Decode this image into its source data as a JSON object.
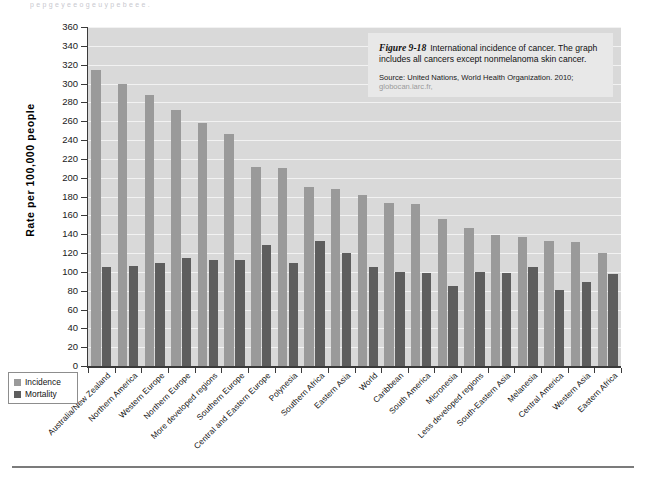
{
  "page": {
    "top_text_fragment": "p       e   p      g     e     y     e    e   o   g     e   u   y   p          e  b           e      e  e  ."
  },
  "caption": {
    "figure_number": "Figure 9-18",
    "text": "International incidence of cancer. The graph includes all cancers except nonmelanoma skin cancer.",
    "source_prefix": "Source: United Nations, World Health Organization. 2010;",
    "source_url": "globocan.iarc.fr,"
  },
  "legend": {
    "position": "bottom-left",
    "items": [
      {
        "label": "Incidence",
        "color": "#9a9a9a"
      },
      {
        "label": "Mortality",
        "color": "#5e5e5e"
      }
    ]
  },
  "chart_data": {
    "type": "bar",
    "title": "International incidence of cancer",
    "xlabel": "",
    "ylabel": "Rate per 100,000 people",
    "ylim": [
      0,
      360
    ],
    "ytick_step": 20,
    "yticks": [
      0,
      20,
      40,
      60,
      80,
      100,
      120,
      140,
      160,
      180,
      200,
      220,
      240,
      260,
      280,
      300,
      320,
      340,
      360
    ],
    "grid": true,
    "legend_position": "bottom-left",
    "categories": [
      "Australia/New Zealand",
      "Northern America",
      "Western Europe",
      "Northern Europe",
      "More developed regions",
      "Southern Europe",
      "Central and Eastern Europe",
      "Polynesia",
      "Southern Africa",
      "Eastern Asia",
      "World",
      "Caribbean",
      "South America",
      "Micronesia",
      "Less developed regions",
      "South-Eastern Asia",
      "Melanesia",
      "Central America",
      "Western Asia",
      "Eastern Africa"
    ],
    "series": [
      {
        "name": "Incidence",
        "color": "#9a9a9a",
        "values": [
          314,
          300,
          288,
          272,
          258,
          246,
          211,
          210,
          190,
          188,
          182,
          173,
          172,
          156,
          147,
          139,
          137,
          133,
          132,
          120
        ]
      },
      {
        "name": "Mortality",
        "color": "#5e5e5e",
        "values": [
          105,
          106,
          109,
          115,
          113,
          113,
          128,
          109,
          133,
          120,
          105,
          100,
          99,
          85,
          100,
          99,
          105,
          81,
          89,
          98
        ]
      }
    ]
  }
}
